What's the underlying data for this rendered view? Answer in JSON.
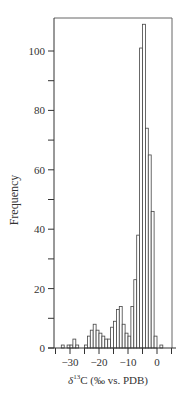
{
  "chart_data": {
    "type": "bar",
    "subtype": "histogram",
    "title": "",
    "xlabel": "δ13C (‰ vs. PDB)",
    "xlabel_parts": {
      "delta": "δ",
      "sup": "13",
      "rest": "C (‰ vs. PDB)"
    },
    "ylabel": "Frequency",
    "xlim": [
      -36,
      5
    ],
    "ylim": [
      0,
      114
    ],
    "bin_width": 1,
    "x_ticks_major": [
      -30,
      -20,
      -10,
      0
    ],
    "x_tick_labels": [
      "−30",
      "−20",
      "−10",
      "0"
    ],
    "x_ticks_minor": [
      -35,
      -25,
      -15,
      -5,
      5
    ],
    "y_ticks_major": [
      0,
      20,
      40,
      60,
      80,
      100
    ],
    "y_tick_labels": [
      "0",
      "20",
      "40",
      "60",
      "80",
      "100"
    ],
    "y_ticks_minor": [
      10,
      30,
      50,
      70,
      90
    ],
    "grid": false,
    "legend": null,
    "bins_left_edges": [
      -33,
      -32,
      -31,
      -30,
      -29,
      -28,
      -27,
      -26,
      -25,
      -24,
      -23,
      -22,
      -21,
      -20,
      -19,
      -18,
      -17,
      -16,
      -15,
      -14,
      -13,
      -12,
      -11,
      -10,
      -9,
      -8,
      -7,
      -6,
      -5,
      -4,
      -3,
      -2,
      -1,
      0,
      1
    ],
    "values": [
      1,
      0,
      1,
      1,
      3,
      1,
      0,
      0,
      1,
      4,
      6,
      8,
      6,
      5,
      4,
      3,
      3,
      7,
      9,
      13,
      14,
      8,
      5,
      4,
      14,
      23,
      38,
      101,
      109,
      74,
      65,
      46,
      4,
      0,
      1
    ]
  },
  "colors": {
    "axis": "#333333",
    "bar_stroke": "#444444",
    "bar_fill": "#ffffff",
    "frame": "#666666"
  }
}
